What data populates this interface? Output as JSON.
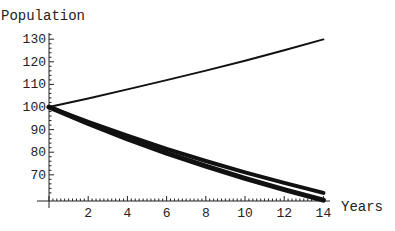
{
  "chart_data": {
    "type": "line",
    "title": "",
    "xlabel": "Years",
    "ylabel": "Population",
    "xlim": [
      0,
      14
    ],
    "ylim": [
      60,
      130
    ],
    "x_ticks": [
      2,
      4,
      6,
      8,
      10,
      12,
      14
    ],
    "y_ticks": [
      70,
      80,
      90,
      100,
      110,
      120,
      130
    ],
    "grid": false,
    "legend": null,
    "x": [
      0,
      2,
      4,
      6,
      8,
      10,
      12,
      14
    ],
    "series": [
      {
        "name": "growth",
        "stroke_width": 2,
        "values": [
          100,
          103.8,
          107.8,
          111.9,
          116.1,
          120.5,
          125.1,
          129.9
        ]
      },
      {
        "name": "decay-1",
        "stroke_width": 4,
        "values": [
          100,
          93.4,
          87.3,
          81.5,
          76.1,
          71.1,
          66.4,
          62.0
        ]
      },
      {
        "name": "decay-2",
        "stroke_width": 5,
        "values": [
          100,
          92.7,
          85.9,
          79.6,
          73.8,
          68.4,
          63.4,
          58.8
        ]
      }
    ]
  }
}
